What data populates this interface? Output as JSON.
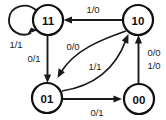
{
  "diagram": {
    "type": "finite-state-machine",
    "title": "",
    "width": 166,
    "height": 120,
    "background_color": "#ffffff",
    "stroke_color": "#111111",
    "states": [
      {
        "id": "s11",
        "label": "11",
        "cx": 48,
        "cy": 20,
        "r": 15
      },
      {
        "id": "s10",
        "label": "10",
        "cx": 138,
        "cy": 20,
        "r": 15
      },
      {
        "id": "s01",
        "label": "01",
        "cx": 47,
        "cy": 98,
        "r": 15
      },
      {
        "id": "s00",
        "label": "00",
        "cx": 139,
        "cy": 99,
        "r": 15
      }
    ],
    "transitions": [
      {
        "id": "t-11-11",
        "from": "s11",
        "to": "s11",
        "label": "1/1",
        "label_x": 16,
        "label_y": 44,
        "kind": "self-loop"
      },
      {
        "id": "t-10-11",
        "from": "s10",
        "to": "s11",
        "label": "1/0",
        "label_x": 93,
        "label_y": 9,
        "kind": "straight"
      },
      {
        "id": "t-11-01",
        "from": "s11",
        "to": "s01",
        "label": "0/1",
        "label_x": 34,
        "label_y": 58,
        "kind": "straight"
      },
      {
        "id": "t-10-01",
        "from": "s10",
        "to": "s01",
        "label": "0/0",
        "label_x": 73,
        "label_y": 46,
        "kind": "curve"
      },
      {
        "id": "t-01-10",
        "from": "s01",
        "to": "s10",
        "label": "1/1",
        "label_x": 95,
        "label_y": 66,
        "kind": "curve"
      },
      {
        "id": "t-01-00",
        "from": "s01",
        "to": "s00",
        "label": "0/1",
        "label_x": 97,
        "label_y": 112,
        "kind": "straight"
      },
      {
        "id": "t-00-10a",
        "from": "s00",
        "to": "s10",
        "label": "0/0",
        "label_x": 154,
        "label_y": 52,
        "kind": "straight"
      },
      {
        "id": "t-00-10b",
        "from": "s00",
        "to": "s10",
        "label": "1/0",
        "label_x": 154,
        "label_y": 65,
        "kind": "shared"
      }
    ]
  }
}
